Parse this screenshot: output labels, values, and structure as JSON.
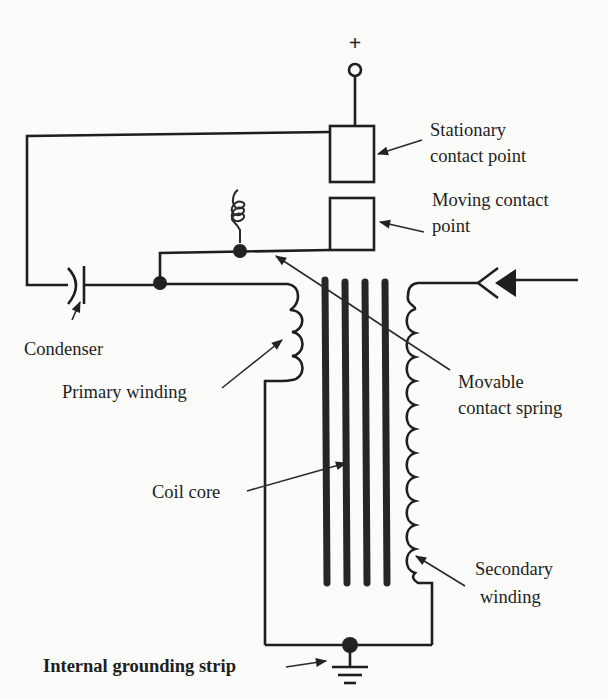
{
  "diagram": {
    "type": "ignition coil circuit schematic",
    "terminal": {
      "symbol": "+"
    },
    "labels": {
      "stationary_line1": "Stationary",
      "stationary_line2": "contact point",
      "moving_line1": "Moving contact",
      "moving_line2": "point",
      "condenser": "Condenser",
      "primary": "Primary winding",
      "movable_line1": "Movable",
      "movable_line2": "contact spring",
      "core": "Coil core",
      "secondary_line1": "Secondary",
      "secondary_line2": "winding",
      "ground": "Internal grounding strip"
    },
    "colors": {
      "ink": "#1e1e1e",
      "paper": "#fbfbf9"
    }
  }
}
